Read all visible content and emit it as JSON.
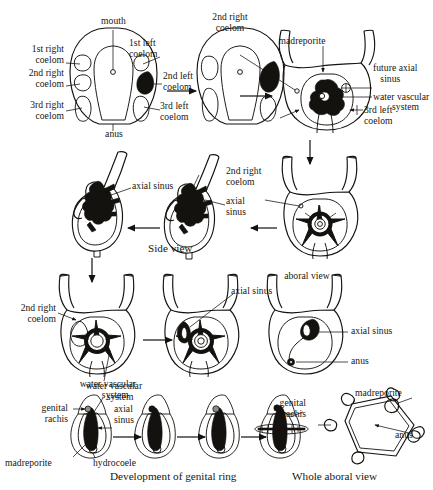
{
  "figure": {
    "captions": [
      {
        "id": "dev-genital-ring",
        "text": "Development of genital ring"
      },
      {
        "id": "whole-aboral-view",
        "text": "Whole aboral view"
      }
    ]
  },
  "row1": {
    "stage1": {
      "labels": {
        "mouth": "mouth",
        "anus": "anus",
        "first_right_coelom": "1st right\ncoelom",
        "second_right_coelom": "2nd right\ncoelom",
        "third_right_coelom": "3rd right\ncoelom",
        "first_left_coelom": "1st left\ncoelom",
        "second_left_coelom": "2nd left\ncoelom",
        "third_left_coelom": "3rd left\ncoelom"
      }
    },
    "stage2": {
      "labels": {
        "second_right_coelom": "2nd right\ncoelom",
        "third_right_coelom": "3rd right\ncoelom"
      }
    },
    "stage3": {
      "labels": {
        "madreporite": "madreporite",
        "future_axial_sinus": "future axial\n   sinus",
        "water_vascular_system": "water vascular",
        "water_vascular_system_2": "system",
        "third_left_coelom": "3rd left\ncoelom"
      }
    }
  },
  "row2": {
    "stage_left": {
      "labels": {
        "axial_sinus": "axial sinus",
        "view_name": "Side view"
      }
    },
    "stage_middle": {
      "labels": {
        "second_right_coelom": "2nd right\ncoelom",
        "axial_sinus": "axial\nsinus"
      }
    }
  },
  "row3": {
    "stage_left": {
      "labels": {
        "second_right_coelom": "2nd right\ncoelom",
        "water_vascular_system": "water vascular\n      system"
      }
    },
    "stage_middle": {
      "labels": {
        "axial_sinus": "axial sinus"
      }
    },
    "stage_right": {
      "labels": {
        "view_name": "aboral view",
        "axial_sinus": "axial sinus",
        "anus": "anus"
      }
    }
  },
  "row4": {
    "stage1": {
      "labels": {
        "water_vascular_system": "water vascular\n     system",
        "genital_rachis": "genital\nrachis",
        "axial_sinus": "axial\nsinus",
        "madreporite": "madreporite",
        "hydrocoele": "hydrocoele"
      }
    },
    "stage4": {
      "labels": {
        "genital_rachis": "genital\nrachis"
      }
    },
    "aboral": {
      "labels": {
        "madreporite": "madreporite",
        "anus": "anus"
      }
    }
  },
  "colors": {
    "ink": "#14120e",
    "paper": "#ffffff",
    "shade": "#8c8c88"
  }
}
